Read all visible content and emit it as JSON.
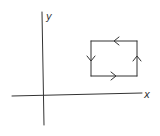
{
  "diagram": {
    "type": "axes-with-closed-loop",
    "axes": {
      "x_label": "x",
      "y_label": "y"
    },
    "loop": {
      "shape": "rectangle",
      "orientation": "counterclockwise",
      "arrows": [
        {
          "side": "top",
          "direction": "left"
        },
        {
          "side": "left",
          "direction": "down"
        },
        {
          "side": "bottom",
          "direction": "right"
        },
        {
          "side": "right",
          "direction": "up"
        }
      ]
    },
    "colors": {
      "ink": "#333333",
      "background": "#ffffff"
    }
  }
}
